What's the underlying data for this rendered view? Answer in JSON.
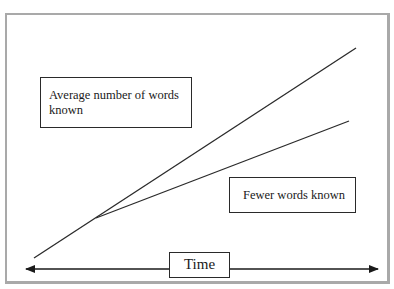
{
  "diagram": {
    "labels": {
      "average": "Average number of words known",
      "fewer": "Fewer words known",
      "time_axis": "Time"
    },
    "colors": {
      "frame": "#a9a9a9",
      "line": "#2a2a2a",
      "background": "#ffffff"
    },
    "lines": [
      {
        "name": "average-words-line",
        "from": [
          34,
          258
        ],
        "to": [
          356,
          48
        ]
      },
      {
        "name": "fewer-words-line",
        "from": [
          96,
          218
        ],
        "to": [
          349,
          121
        ]
      }
    ],
    "axis": {
      "name": "time-axis",
      "from": [
        26,
        269
      ],
      "to": [
        378,
        269
      ],
      "arrows": "both"
    }
  }
}
